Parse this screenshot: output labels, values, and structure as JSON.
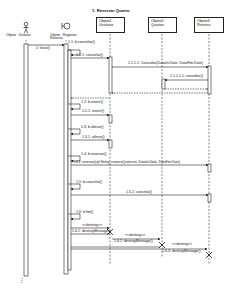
{
  "diagram": {
    "title": "1. Reservar Quarto",
    "actors": [
      {
        "label": "Objeto : Usuário",
        "type": "actor"
      },
      {
        "label": "Objeto : Registrar Reserva",
        "type": "boundary"
      }
    ],
    "objects": [
      {
        "line1": "Objeto1 :",
        "line2": "Usuários"
      },
      {
        "line1": "Objeto2 :",
        "line2": "Quartos"
      },
      {
        "line1": "Objeto3 :",
        "line2": "Reserva"
      }
    ],
    "messages": [
      {
        "id": "m1",
        "label": "1: listar()"
      },
      {
        "id": "m1_1",
        "label": "1.1: b.consultar()"
      },
      {
        "id": "m1_1_1",
        "label": "1.1.1: consultar()"
      },
      {
        "id": "m1_1_1_1",
        "label": "1.1.1.1: Consultar(DataIni:Date, DataFim:Date)"
      },
      {
        "id": "m1_1_1_1_1",
        "label": "1.1.1.1.1: consultar()"
      },
      {
        "id": "m1_2",
        "label": "1.2: b.inserir()"
      },
      {
        "id": "m1_2_1",
        "label": "1.2.1: inserir()"
      },
      {
        "id": "m1_3",
        "label": "1.3: b.alterar()"
      },
      {
        "id": "m1_3_1",
        "label": "1.3.1: alterar()"
      },
      {
        "id": "m1_4",
        "label": "1.4: b.reservar()"
      },
      {
        "id": "m1_4_1",
        "label": "1.4.1: reservar(cpf:String, numeroQuarto:int, DataIni:Date, DataFim:Date)"
      },
      {
        "id": "m1_5",
        "label": "1.5: b.cancelar()"
      },
      {
        "id": "m1_5_1",
        "label": "1.5.1: cancelar()"
      },
      {
        "id": "m1_6",
        "label": "1.6: b.fim()"
      },
      {
        "id": "m1_6_1_stereo",
        "label": "<<destroy>>"
      },
      {
        "id": "m1_6_1",
        "label": "1.6.1: destroyMessage()"
      },
      {
        "id": "m1_6_2_stereo",
        "label": "<<destroy>>"
      },
      {
        "id": "m1_6_2",
        "label": "1.6.2: destroyMessage()"
      },
      {
        "id": "m1_6_3_stereo",
        "label": "<<destroy>>"
      },
      {
        "id": "m1_6_3",
        "label": "1.6.3: destroyMessage()"
      }
    ]
  }
}
